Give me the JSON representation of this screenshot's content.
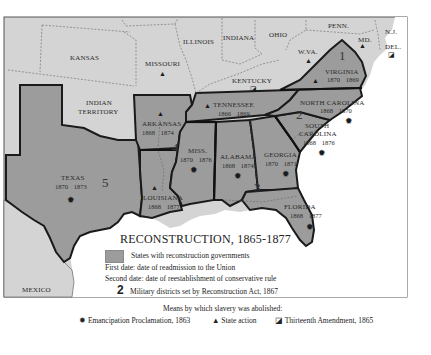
{
  "map": {
    "title": "RECONSTRUCTION, 1865-1877",
    "colors": {
      "reconstruction_state": "#9c9c9c",
      "other_land": "#d4d4d4",
      "water": "#ffffff",
      "border": "#1a1a1a"
    },
    "regions": {
      "kansas": "KANSAS",
      "missouri": "MISSOURI",
      "illinois": "ILLINOIS",
      "indiana": "INDIANA",
      "ohio": "OHIO",
      "penn": "PENN.",
      "nj": "N.J.",
      "md": "MD.",
      "del": "DEL.",
      "wva": "W.VA.",
      "kentucky": "KENTUCKY",
      "indian_territory_1": "INDIAN",
      "indian_territory_2": "TERRITORY",
      "mexico": "MEXICO"
    },
    "states": [
      {
        "id": "virginia",
        "name": "VIRGINIA",
        "readmitted": "1870",
        "conservative_rule": "1869",
        "abolition": "state-action"
      },
      {
        "id": "north_carolina",
        "name": "NORTH CAROLINA",
        "readmitted": "1868",
        "conservative_rule": "1870",
        "abolition": "emancipation-proclamation"
      },
      {
        "id": "south_carolina",
        "name_1": "SOUTH",
        "name_2": "CAROLINA",
        "readmitted": "1868",
        "conservative_rule": "1876",
        "abolition": "emancipation-proclamation"
      },
      {
        "id": "georgia",
        "name": "GEORGIA",
        "readmitted": "1870",
        "conservative_rule": "1871",
        "abolition": "emancipation-proclamation"
      },
      {
        "id": "florida",
        "name": "FLORIDA",
        "readmitted": "1868",
        "conservative_rule": "1877",
        "abolition": "emancipation-proclamation"
      },
      {
        "id": "alabama",
        "name": "ALABAMA",
        "readmitted": "1868",
        "conservative_rule": "1874",
        "abolition": "emancipation-proclamation"
      },
      {
        "id": "mississippi",
        "name": "MISS.",
        "readmitted": "1870",
        "conservative_rule": "1876",
        "abolition": "emancipation-proclamation"
      },
      {
        "id": "louisiana",
        "name": "LOUISIANA",
        "readmitted": "1868",
        "conservative_rule": "1877",
        "abolition": "state-action"
      },
      {
        "id": "texas",
        "name": "TEXAS",
        "readmitted": "1870",
        "conservative_rule": "1873",
        "abolition": "emancipation-proclamation"
      },
      {
        "id": "arkansas",
        "name": "ARKANSAS",
        "readmitted": "1868",
        "conservative_rule": "1874",
        "abolition": "state-action"
      },
      {
        "id": "tennessee",
        "name": "TENNESSEE",
        "readmitted": "1866",
        "conservative_rule": "1869",
        "abolition": "state-action"
      }
    ],
    "military_districts": [
      "1",
      "2",
      "3",
      "4",
      "5"
    ],
    "symbols": {
      "emancipation_proclamation": "✹",
      "state_action": "▲",
      "thirteenth_amendment": "◪"
    }
  },
  "legend": {
    "title": "RECONSTRUCTION, 1865-1877",
    "swatch_label": "States with reconstruction governments",
    "first_date": "First date: date of readmission to the Union",
    "second_date": "Second date: date of reestablishment of conservative rule",
    "district_number": "2",
    "district_label": "Military districts set by Reconstruction Act, 1867",
    "means_heading": "Means by which slavery was abolished:",
    "emancipation": "Emancipation Proclamation, 1863",
    "state_action": "State action",
    "thirteenth": "Thirteenth Amendment, 1865"
  }
}
